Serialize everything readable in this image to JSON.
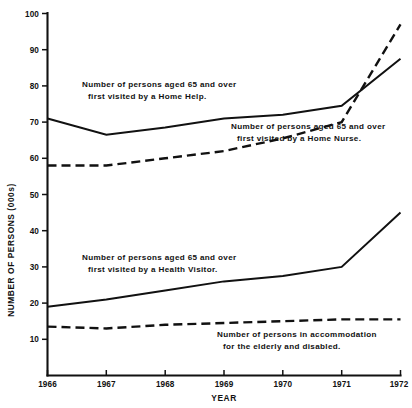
{
  "chart_data": {
    "type": "line",
    "title": "",
    "xlabel": "YEAR",
    "ylabel": "NUMBER OF PERSONS (000s)",
    "x": [
      1966,
      1967,
      1968,
      1969,
      1970,
      1971,
      1972
    ],
    "xtick_labels": [
      "1966",
      "1967",
      "1968",
      "1969",
      "1970",
      "1971",
      "1972"
    ],
    "ytick_labels": [
      "10",
      "20",
      "30",
      "40",
      "50",
      "60",
      "70",
      "80",
      "90",
      "100"
    ],
    "yticks": [
      10,
      20,
      30,
      40,
      50,
      60,
      70,
      80,
      90,
      100
    ],
    "xlim": [
      1966,
      1972
    ],
    "ylim": [
      0,
      100
    ],
    "grid": false,
    "legend_position": "inline-annotations",
    "series": [
      {
        "name": "Number of persons aged 65 and over first visited by a Home Help.",
        "style": "solid",
        "color": "#111111",
        "values": [
          71,
          66.5,
          68.5,
          71,
          72,
          74.5,
          87.5
        ]
      },
      {
        "name": "Number of persons aged 65 and over first visited by a Home Nurse.",
        "style": "dashed",
        "color": "#111111",
        "values": [
          58,
          58,
          60,
          62,
          65.5,
          70,
          97
        ]
      },
      {
        "name": "Number of persons aged 65 and over first visited by a Health Visitor.",
        "style": "solid",
        "color": "#111111",
        "values": [
          19,
          21,
          23.5,
          26,
          27.5,
          30,
          45
        ]
      },
      {
        "name": "Number of persons in accommodation for the elderly and disabled.",
        "style": "dashed",
        "color": "#111111",
        "values": [
          13.5,
          13,
          14,
          14.5,
          15,
          15.5,
          15.5
        ]
      }
    ],
    "annotations": [
      {
        "id": "home-help",
        "line1": "Number of persons aged 65 and over",
        "line2": "first visited by a Home Help."
      },
      {
        "id": "home-nurse",
        "line1": "Number of persons aged 65 and over",
        "line2": "first visited by a Home Nurse."
      },
      {
        "id": "health-visitor",
        "line1": "Number of persons aged 65 and over",
        "line2": "first visited by a Health Visitor."
      },
      {
        "id": "accommodation",
        "line1": "Number of persons in accommodation",
        "line2": "for the elderly and disabled."
      }
    ]
  }
}
